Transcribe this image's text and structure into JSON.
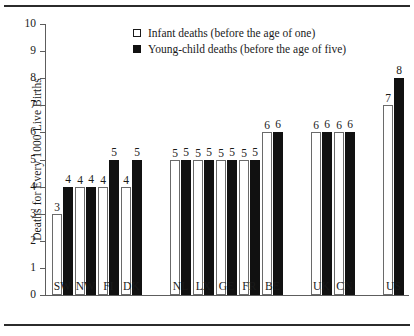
{
  "chart_data": {
    "type": "bar",
    "title": "",
    "xlabel": "",
    "ylabel": "Deaths for Every 1000 Live Births",
    "ylim": [
      0,
      10
    ],
    "ytick_labels": [
      "0",
      "1",
      "2",
      "3",
      "4",
      "5",
      "6",
      "7",
      "8",
      "9",
      "10"
    ],
    "grid": false,
    "legend_position": "top-center",
    "categories": [
      "SW",
      "NW",
      "FI",
      "DK",
      "NL",
      "LX",
      "GE",
      "FR",
      "BE",
      "UK",
      "CN",
      "US"
    ],
    "series": [
      {
        "name": "Infant deaths (before the age of one)",
        "color": "#ffffff",
        "values": [
          3,
          4,
          4,
          4,
          5,
          5,
          5,
          5,
          6,
          6,
          6,
          7
        ]
      },
      {
        "name": "Young-child deaths (before the age of five)",
        "color": "#111111",
        "values": [
          4,
          4,
          5,
          5,
          5,
          5,
          5,
          5,
          6,
          6,
          6,
          8
        ]
      }
    ],
    "groups": [
      {
        "categories": [
          "SW",
          "NW",
          "FI",
          "DK"
        ]
      },
      {
        "categories": [
          "NL",
          "LX",
          "GE",
          "FR",
          "BE"
        ]
      },
      {
        "categories": [
          "UK",
          "CN"
        ]
      },
      {
        "categories": [
          "US"
        ]
      }
    ]
  },
  "legend": {
    "items": [
      {
        "swatch": "open-square",
        "label": "Infant deaths (before the age of one)"
      },
      {
        "swatch": "filled-square",
        "label": "Young-child deaths (before the age of five)"
      }
    ]
  },
  "axis": {
    "y_title": "Deaths for Every 1000 Live Births",
    "ticks": [
      "10",
      "9",
      "8",
      "7",
      "6",
      "5",
      "4",
      "3",
      "2",
      "1",
      "0"
    ]
  }
}
